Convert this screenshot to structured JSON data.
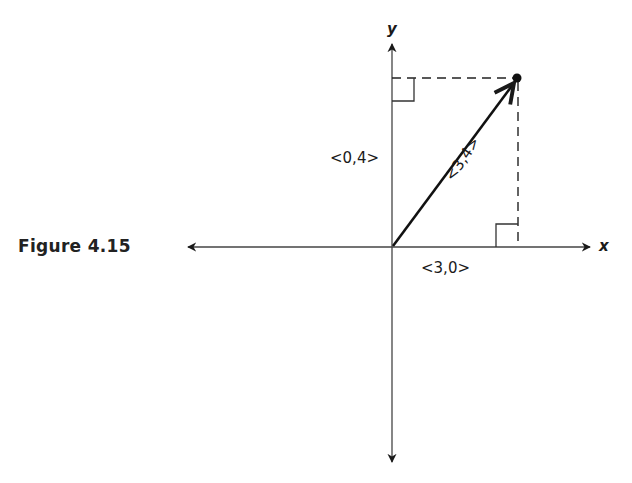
{
  "figure": {
    "caption": "Figure 4.15",
    "axes": {
      "x_label": "x",
      "y_label": "y"
    },
    "vectors": [
      {
        "name": "resultant",
        "label": "<3,4>",
        "from": [
          0,
          0
        ],
        "to": [
          3,
          4
        ]
      },
      {
        "name": "x-component",
        "label": "<3,0>",
        "from": [
          0,
          0
        ],
        "to": [
          3,
          0
        ]
      },
      {
        "name": "y-component",
        "label": "<0,4>",
        "from": [
          0,
          0
        ],
        "to": [
          0,
          4
        ]
      }
    ],
    "labels": {
      "vec_34": "<3,4>",
      "vec_30": "<3,0>",
      "vec_04": "<0,4>"
    }
  }
}
